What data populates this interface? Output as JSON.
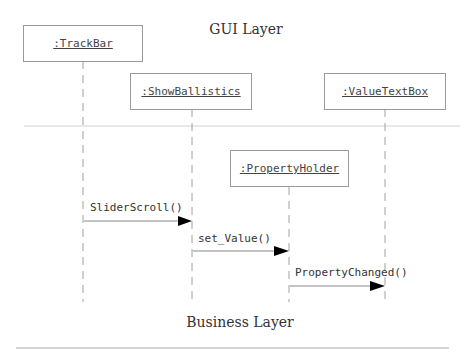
{
  "diagram": {
    "type": "uml-sequence",
    "layers": {
      "top": "GUI Layer",
      "bottom": "Business Layer"
    },
    "objects": [
      {
        "id": "trackbar",
        "label": ":TrackBar",
        "layer": "GUI Layer"
      },
      {
        "id": "showballistics",
        "label": ":ShowBallistics",
        "layer": "GUI Layer"
      },
      {
        "id": "valuetextbox",
        "label": ":ValueTextBox",
        "layer": "GUI Layer"
      },
      {
        "id": "propertyholder",
        "label": ":PropertyHolder",
        "layer": "Business Layer"
      }
    ],
    "messages": [
      {
        "label": "SliderScroll()",
        "from": ":TrackBar",
        "to": ":ShowBallistics"
      },
      {
        "label": "set_Value()",
        "from": ":ShowBallistics",
        "to": ":PropertyHolder"
      },
      {
        "label": "PropertyChanged()",
        "from": ":PropertyHolder",
        "to": ":ValueTextBox"
      }
    ],
    "colors": {
      "line": "#9a9a9a",
      "separator": "#c8c8c8",
      "arrowhead": "#000000",
      "text": "#333333"
    }
  }
}
